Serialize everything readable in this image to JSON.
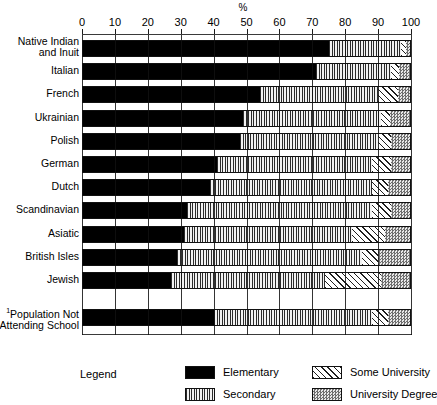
{
  "chart_data": {
    "type": "bar",
    "orientation": "horizontal",
    "stacked": true,
    "title": "",
    "xlabel": "%",
    "ylabel": "",
    "xlim": [
      0,
      100
    ],
    "xticks": [
      0,
      10,
      20,
      30,
      40,
      50,
      60,
      70,
      80,
      90,
      100
    ],
    "grid": true,
    "legend_position": "bottom",
    "legend_title": "Legend",
    "series": [
      {
        "name": "Elementary",
        "pattern": "solid-black",
        "values": [
          75,
          71,
          54,
          49,
          48,
          41,
          39,
          32,
          31,
          29,
          27,
          40
        ]
      },
      {
        "name": "Secondary",
        "pattern": "vertical-lines",
        "values": [
          22,
          23,
          36,
          42,
          42,
          47,
          49,
          56,
          51,
          56,
          47,
          48
        ]
      },
      {
        "name": "Some University",
        "pattern": "diagonal-hatch",
        "values": [
          1.5,
          2.5,
          6,
          2.5,
          4,
          6,
          5,
          6,
          10,
          5,
          17,
          5
        ]
      },
      {
        "name": "University Degree",
        "pattern": "stipple-gray",
        "values": [
          1.5,
          3.5,
          4,
          6.5,
          6,
          6,
          7,
          6,
          8,
          10,
          9,
          7
        ]
      }
    ],
    "categories": [
      "Native Indian and Inuit",
      "Italian",
      "French",
      "Ukrainian",
      "Polish",
      "German",
      "Dutch",
      "Scandinavian",
      "Asiatic",
      "British Isles",
      "Jewish",
      "Population Not Attending School"
    ],
    "category_labels": [
      {
        "line1": "Native Indian",
        "line2": "and Inuit",
        "footnote": ""
      },
      {
        "line1": "Italian",
        "line2": "",
        "footnote": ""
      },
      {
        "line1": "French",
        "line2": "",
        "footnote": ""
      },
      {
        "line1": "Ukrainian",
        "line2": "",
        "footnote": ""
      },
      {
        "line1": "Polish",
        "line2": "",
        "footnote": ""
      },
      {
        "line1": "German",
        "line2": "",
        "footnote": ""
      },
      {
        "line1": "Dutch",
        "line2": "",
        "footnote": ""
      },
      {
        "line1": "Scandinavian",
        "line2": "",
        "footnote": ""
      },
      {
        "line1": "Asiatic",
        "line2": "",
        "footnote": ""
      },
      {
        "line1": "British Isles",
        "line2": "",
        "footnote": ""
      },
      {
        "line1": "Jewish",
        "line2": "",
        "footnote": ""
      },
      {
        "line1": "Population Not",
        "line2": "Attending School",
        "footnote": "1"
      }
    ]
  },
  "axis": {
    "unit_label": "%",
    "ticks": [
      "0",
      "10",
      "20",
      "30",
      "40",
      "50",
      "60",
      "70",
      "80",
      "90",
      "100"
    ]
  },
  "legend": {
    "title": "Legend",
    "entries": [
      {
        "label": "Elementary",
        "pattern": "solid-black"
      },
      {
        "label": "Secondary",
        "pattern": "vertical-lines"
      },
      {
        "label": "Some University",
        "pattern": "diagonal-hatch"
      },
      {
        "label": "University Degree",
        "pattern": "stipple-gray"
      }
    ]
  },
  "colors": {
    "elementary": "#000000",
    "secondary": "#2b2b2b",
    "some_university": "#1f1f1f",
    "university_degree": "#6e6e6e",
    "axis": "#111111",
    "background": "#ffffff"
  }
}
